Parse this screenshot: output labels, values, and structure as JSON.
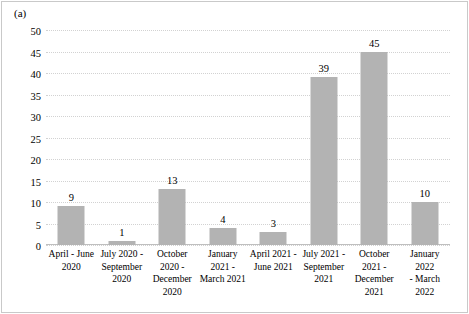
{
  "panel": {
    "label": "(a)"
  },
  "chart_data": {
    "type": "bar",
    "title": "",
    "xlabel": "",
    "ylabel": "",
    "ylim": [
      0,
      50
    ],
    "yticks": [
      0,
      5,
      10,
      15,
      20,
      25,
      30,
      35,
      40,
      45,
      50
    ],
    "grid": true,
    "legend": null,
    "bar_color": "#b3b3b3",
    "categories": [
      "April - June 2020",
      "July 2020 - September 2020",
      "October 2020 - December 2020",
      "January 2021 - March 2021",
      "April 2021 - June 2021",
      "July 2021 - September 2021",
      "October 2021 - December 2021",
      "January 2022 - March 2022"
    ],
    "category_lines": [
      [
        "April - June",
        "2020"
      ],
      [
        "July 2020 -",
        "September",
        "2020"
      ],
      [
        "October 2020 -",
        "December",
        "2020"
      ],
      [
        "January",
        "2021 -",
        "March 2021"
      ],
      [
        "April 2021 -",
        "June 2021"
      ],
      [
        "July 2021 -",
        "September",
        "2021"
      ],
      [
        "October",
        "2021 -",
        "December 2021"
      ],
      [
        "January 2022",
        "- March",
        "2022"
      ]
    ],
    "values": [
      9,
      1,
      13,
      4,
      3,
      39,
      45,
      10
    ],
    "data_labels": [
      "9",
      "1",
      "13",
      "4",
      "3",
      "39",
      "45",
      "10"
    ]
  }
}
